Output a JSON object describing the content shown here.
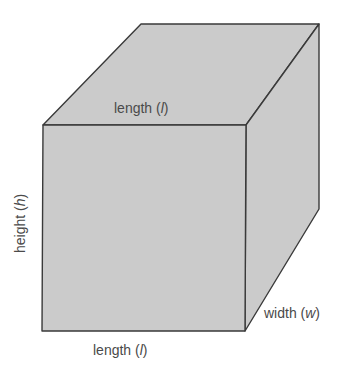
{
  "diagram": {
    "type": "rectangular-prism",
    "colors": {
      "fill": "#cbcbcb",
      "edge": "#3a3a3a",
      "text": "#4a4a4a"
    },
    "labels": {
      "top_length": {
        "prefix": "length (",
        "var": "l",
        "suffix": ")"
      },
      "bottom_length": {
        "prefix": "length (",
        "var": "l",
        "suffix": ")"
      },
      "height": {
        "prefix": "height (",
        "var": "h",
        "suffix": ")"
      },
      "width": {
        "prefix": "width (",
        "var": "w",
        "suffix": ")"
      }
    }
  }
}
